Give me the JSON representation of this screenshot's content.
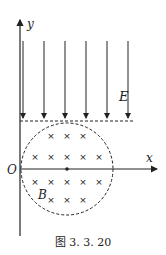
{
  "figure": {
    "caption": "图 3. 3. 20",
    "axes": {
      "x_label": "x",
      "y_label": "y",
      "origin_label": "O"
    },
    "field_labels": {
      "electric": "E",
      "magnetic": "B"
    },
    "electric_field": {
      "direction": "down",
      "arrow_count": 6
    },
    "magnetic_field": {
      "symbol": "×",
      "direction": "into-page",
      "rows": [
        3,
        5,
        5,
        3
      ]
    },
    "colors": {
      "ink": "#222222",
      "background": "#ffffff"
    }
  }
}
